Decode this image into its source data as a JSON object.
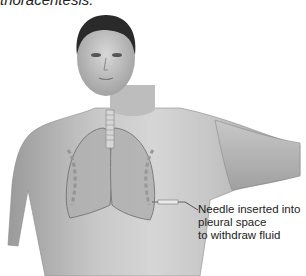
{
  "caption_fragment": "thoracentesis.",
  "figure": {
    "annotation": {
      "lines": [
        "Needle inserted into",
        "pleural space",
        "to withdraw fluid"
      ]
    }
  }
}
